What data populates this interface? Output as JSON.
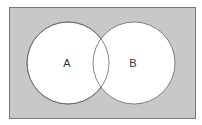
{
  "diagram": {
    "type": "venn",
    "universe": {
      "fill": "#c8c8c8",
      "stroke": "#777777"
    },
    "sets": [
      {
        "label": "A",
        "fill": "#ffffff",
        "stroke": "#666666"
      },
      {
        "label": "B",
        "fill": "#ffffff",
        "stroke": "#666666"
      }
    ]
  }
}
